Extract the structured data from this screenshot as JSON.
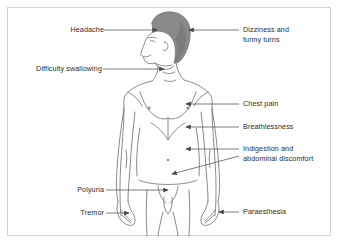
{
  "figure": {
    "hair_color": "#8a8a8a",
    "outline_color": "#6d6d6d",
    "frame_color": "#d2d2d2",
    "background": "#ffffff",
    "text_color": "#2b2b2b",
    "leader_color": "#5a5a5a"
  },
  "labels": {
    "left": [
      {
        "id": "headache",
        "text": "Headache",
        "x": 62,
        "y": 27,
        "line_from": 104,
        "line_to": 156,
        "line_y": 30,
        "arrow": "right"
      },
      {
        "id": "difficulty-swallowing",
        "text": "Difficulty swallowing",
        "x": 30,
        "y": 66,
        "line_from": 103,
        "line_to": 163,
        "line_y": 69,
        "arrow": "right"
      },
      {
        "id": "polyuria",
        "text": "Polyuria",
        "x": 71,
        "y": 187,
        "line_from": 106,
        "line_to": 167,
        "line_y": 190,
        "arrow": "right"
      },
      {
        "id": "tremor",
        "text": "Tremor",
        "x": 75,
        "y": 210,
        "line_from": 106,
        "line_to": 128,
        "line_y": 213,
        "arrow": "right"
      }
    ],
    "right": [
      {
        "id": "dizziness-and-funny-turns",
        "text": "Dizziness and\nfunny turns",
        "x": 243,
        "y": 27,
        "line_from": 190,
        "line_to": 239,
        "line_y": 30,
        "arrow": "left"
      },
      {
        "id": "chest-pain",
        "text": "Chest pain",
        "x": 243,
        "y": 101,
        "line_from": 186,
        "line_to": 239,
        "line_y": 104,
        "arrow": "left"
      },
      {
        "id": "breathlessness",
        "text": "Breathlessness",
        "x": 243,
        "y": 124,
        "line_from": 186,
        "line_to": 239,
        "line_y": 127,
        "arrow": "left"
      },
      {
        "id": "indigestion-and-abdominal-discomfort",
        "text": "Indigestion and\nabdominal discomfort",
        "x": 243,
        "y": 146,
        "line_from": 172,
        "line_to": 239,
        "line_y": 149,
        "arrow": "left"
      },
      {
        "id": "paraesthesia",
        "text": "Paraesthesia",
        "x": 243,
        "y": 209,
        "line_from": 222,
        "line_to": 239,
        "line_y": 212,
        "arrow": "left"
      }
    ]
  },
  "arrow_targets": {
    "headache": "crown of head",
    "difficulty_swallowing": "throat",
    "dizziness": "back of head",
    "chest_pain": "left chest",
    "breathlessness": "sternum",
    "indigestion_upper": "upper abdomen",
    "indigestion_lower": "lower abdomen",
    "polyuria": "groin",
    "tremor": "right hand",
    "paraesthesia": "left hand"
  }
}
